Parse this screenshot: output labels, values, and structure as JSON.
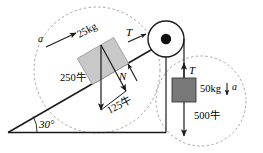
{
  "diagram": {
    "background_color": "#ffffff",
    "stroke_color": "#1a1a1a",
    "dashed_color": "#808080",
    "incline": {
      "angle_label": "30°",
      "angle_value": 30,
      "base_color": "#1a1a1a"
    },
    "incline_block": {
      "mass_label": "25kg",
      "acceleration_label": "a",
      "fill_color": "#c8c8c8",
      "weight_label": "250牛",
      "weight_value": 250,
      "component_label": "125牛",
      "component_value": 125,
      "normal_label": "N",
      "tension_label": "T"
    },
    "hanging_block": {
      "mass_label": "50kg",
      "acceleration_label": "a",
      "fill_color": "#787878",
      "weight_label": "500牛",
      "weight_value": 500,
      "tension_label": "T"
    },
    "pulley": {
      "hub_color": "#111111",
      "rim_color": "#1a1a1a"
    }
  }
}
